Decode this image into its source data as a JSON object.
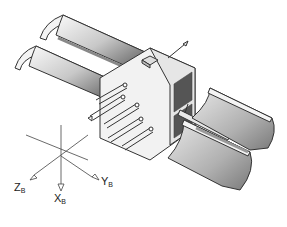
{
  "figure": {
    "colors": {
      "stroke": "#333333",
      "panel_light": "#f4f4f4",
      "panel_dark": "#6e6e6e",
      "body": "#f2f2f2"
    }
  },
  "axes": {
    "z": {
      "main": "Z",
      "sub": "B"
    },
    "x": {
      "main": "X",
      "sub": "B"
    },
    "y": {
      "main": "Y",
      "sub": "B"
    }
  }
}
